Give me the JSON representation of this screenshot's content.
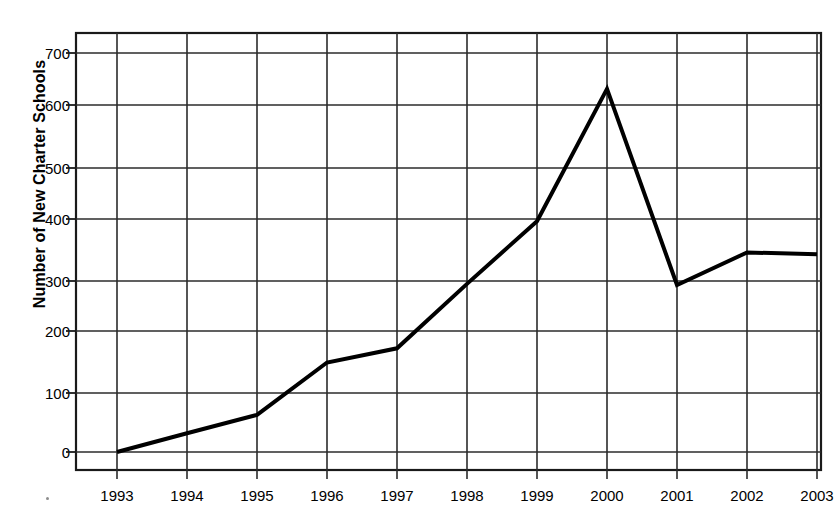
{
  "chart_data": {
    "type": "line",
    "title": "",
    "subtitle": "",
    "xlabel": "",
    "ylabel": "Number of New Charter Schools",
    "categories": [
      "1993",
      "1994",
      "1995",
      "1996",
      "1997",
      "1998",
      "1999",
      "2000",
      "2001",
      "2002",
      "2003"
    ],
    "values": [
      0,
      33,
      65,
      157,
      182,
      295,
      405,
      637,
      293,
      350,
      347
    ],
    "series": [
      {
        "name": "Number of New Charter Schools",
        "values": [
          0,
          33,
          65,
          157,
          182,
          295,
          405,
          637,
          293,
          350,
          347
        ]
      }
    ],
    "xlim": [
      "1993",
      "2003"
    ],
    "ylim": [
      0,
      700
    ],
    "y_ticks": [
      0,
      100,
      200,
      300,
      400,
      500,
      600,
      700
    ],
    "y_tick_labels": [
      "0",
      "100",
      "200",
      "300",
      "400",
      "500",
      "600",
      "700"
    ],
    "x_ticks": [
      "1993",
      "1994",
      "1995",
      "1996",
      "1997",
      "1998",
      "1999",
      "2000",
      "2001",
      "2002",
      "2003"
    ],
    "grid": true,
    "grid_axis": "both",
    "legend": false,
    "legend_position": "none",
    "line_color": "#000000",
    "line_width": 4,
    "grid_color": "#2b2b2b",
    "frame_color": "#1a1a1a",
    "background_color": "#ffffff",
    "markers": false,
    "annotations": []
  },
  "axis": {
    "y_title": "Number of New Charter Schools",
    "y_labels": [
      "700",
      "600",
      "500",
      "400",
      "300",
      "200",
      "100",
      "0"
    ],
    "x_labels": [
      "1993",
      "1994",
      "1995",
      "1996",
      "1997",
      "1998",
      "1999",
      "2000",
      "2001",
      "2002",
      "2003"
    ]
  }
}
